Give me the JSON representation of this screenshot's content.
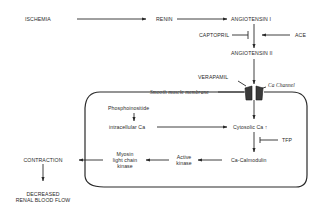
{
  "diagram": {
    "nodes": {
      "ischemia": "ISCHEMIA",
      "renin": "RENIN",
      "angiotensin_1": "ANGIOTENSIN I",
      "captopril": "CAPTOPRIL",
      "ace": "ACE",
      "angiotensin_2": "ANGIOTENSIN II",
      "verapamil": "VERAPAMIL",
      "ca_channel": "Ca Channel",
      "smooth_muscle_membrane": "Smooth muscle membrane",
      "phosphoinositide": "Phosphoinositide",
      "intracellular_ca": "intracellular Ca",
      "cytosolic_ca": "Cytosolic Ca ↑",
      "tfp": "TFP",
      "ca_calmodulin": "Ca-Calmodulin",
      "active_kinase_1": "Active",
      "active_kinase_2": "kinase",
      "mlck_1": "Myosin",
      "mlck_2": "light chain",
      "mlck_3": "kinase",
      "contraction": "CONTRACTION",
      "decreased_1": "DECREASED",
      "decreased_2": "RENAL BLOOD FLOW"
    },
    "edges": [
      {
        "from": "ISCHEMIA",
        "to": "RENIN",
        "type": "arrow"
      },
      {
        "from": "RENIN",
        "to": "ANGIOTENSIN I",
        "type": "arrow"
      },
      {
        "from": "ANGIOTENSIN I",
        "to": "ANGIOTENSIN II",
        "type": "arrow"
      },
      {
        "from": "CAPTOPRIL",
        "to": "ANGIOTENSIN I -> II",
        "type": "inhibit"
      },
      {
        "from": "ACE",
        "to": "ANGIOTENSIN I -> II",
        "type": "arrow"
      },
      {
        "from": "ANGIOTENSIN II",
        "to": "Ca Channel",
        "type": "arrow"
      },
      {
        "from": "VERAPAMIL",
        "to": "Ca Channel",
        "type": "pointer"
      },
      {
        "from": "Ca Channel",
        "to": "Cytosolic Ca",
        "type": "arrow"
      },
      {
        "from": "Phosphoinositide",
        "to": "intracellular Ca",
        "type": "arrow"
      },
      {
        "from": "intracellular Ca",
        "to": "Cytosolic Ca",
        "type": "arrow"
      },
      {
        "from": "TFP",
        "to": "Cytosolic Ca -> Ca-Calmodulin",
        "type": "inhibit"
      },
      {
        "from": "Cytosolic Ca",
        "to": "Ca-Calmodulin",
        "type": "arrow"
      },
      {
        "from": "Ca-Calmodulin",
        "to": "Active kinase",
        "type": "arrow"
      },
      {
        "from": "Active kinase",
        "to": "Myosin light chain kinase",
        "type": "arrow"
      },
      {
        "from": "Myosin light chain kinase",
        "to": "CONTRACTION",
        "type": "arrow"
      },
      {
        "from": "CONTRACTION",
        "to": "DECREASED RENAL BLOOD FLOW",
        "type": "arrow"
      }
    ]
  }
}
